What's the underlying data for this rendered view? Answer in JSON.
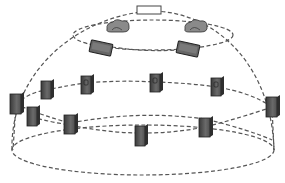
{
  "diagram": {
    "type": "dome-network-topology",
    "background": "#ffffff",
    "line_color": "#555555",
    "node_fill": "#5a5a5a",
    "node_dark": "#333333",
    "top_node": {
      "name": "apex-panel",
      "x": 140,
      "y": 6,
      "w": 25,
      "h": 8
    },
    "tier1_nodes": [
      {
        "name": "cloud-node-left",
        "x": 118,
        "y": 28
      },
      {
        "name": "cloud-node-right",
        "x": 196,
        "y": 28
      }
    ],
    "tier2_nodes": [
      {
        "name": "pad-node-left",
        "x": 101,
        "y": 48
      },
      {
        "name": "pad-node-right",
        "x": 188,
        "y": 49
      }
    ],
    "tier3_nodes": [
      {
        "name": "server-1",
        "x": 16,
        "y": 104
      },
      {
        "name": "server-2",
        "x": 46,
        "y": 90
      },
      {
        "name": "server-3",
        "x": 86,
        "y": 85
      },
      {
        "name": "server-4",
        "x": 155,
        "y": 83
      },
      {
        "name": "server-5",
        "x": 216,
        "y": 87
      },
      {
        "name": "server-6",
        "x": 272,
        "y": 107
      }
    ],
    "tier4_nodes": [
      {
        "name": "server-7",
        "x": 32,
        "y": 117
      },
      {
        "name": "server-8",
        "x": 70,
        "y": 125
      },
      {
        "name": "server-9",
        "x": 140,
        "y": 131
      },
      {
        "name": "server-10",
        "x": 205,
        "y": 127
      }
    ]
  }
}
